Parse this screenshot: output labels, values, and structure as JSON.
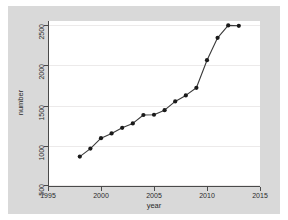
{
  "chart_data": {
    "type": "line",
    "title": "",
    "subtitle": "",
    "xlabel": "year",
    "ylabel": "number",
    "xlim": [
      1995,
      2015
    ],
    "ylim": [
      500,
      2500
    ],
    "xticks": [
      1995,
      2000,
      2005,
      2010,
      2015
    ],
    "yticks": [
      500,
      1000,
      1500,
      2000,
      2500
    ],
    "grid": "horizontal",
    "legend": "none",
    "marker": "filled-circle",
    "line_color": "#3a3a3a",
    "marker_color": "#1a1a1a",
    "plot_background": "#ffffff",
    "figure_background": "#d9d9d9",
    "gridline_color": "#eceaea",
    "x": [
      1998,
      1999,
      2000,
      2001,
      2002,
      2003,
      2004,
      2005,
      2006,
      2007,
      2008,
      2009,
      2010,
      2011,
      2012,
      2013
    ],
    "values": [
      855,
      955,
      1085,
      1145,
      1215,
      1270,
      1375,
      1378,
      1435,
      1545,
      1620,
      1715,
      2060,
      2340,
      2495,
      2490
    ],
    "series": [
      {
        "name": "number",
        "values": [
          855,
          955,
          1085,
          1145,
          1215,
          1270,
          1375,
          1378,
          1435,
          1545,
          1620,
          1715,
          2060,
          2340,
          2495,
          2490
        ]
      }
    ]
  },
  "axes": {
    "y_tick_labels": [
      "500",
      "1000",
      "1500",
      "2000",
      "2500"
    ],
    "x_tick_labels": [
      "1995",
      "2000",
      "2005",
      "2010",
      "2015"
    ],
    "y_title": "number",
    "x_title": "year"
  }
}
